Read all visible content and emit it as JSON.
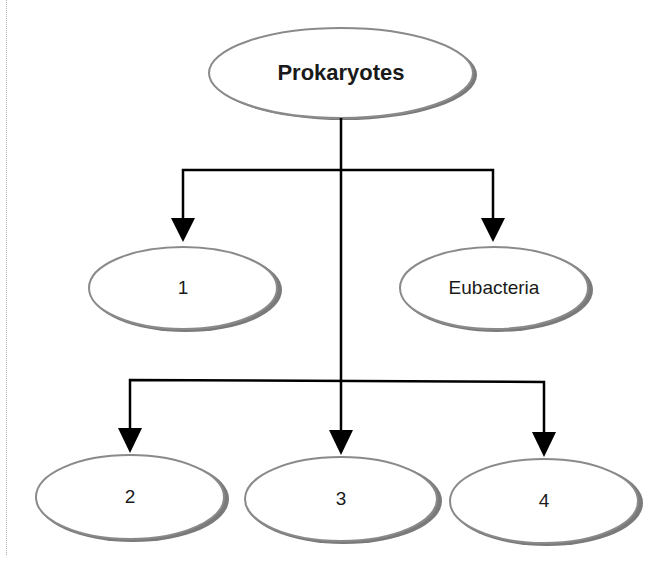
{
  "diagram": {
    "type": "hierarchy",
    "root": {
      "id": "prokaryotes",
      "label": "Prokaryotes",
      "cx": 341,
      "cy": 73
    },
    "nodes": [
      {
        "id": "node-1",
        "label": "1",
        "cx": 183,
        "cy": 288
      },
      {
        "id": "node-eubacteria",
        "label": "Eubacteria",
        "cx": 494,
        "cy": 288
      },
      {
        "id": "node-2",
        "label": "2",
        "cx": 130,
        "cy": 497
      },
      {
        "id": "node-3",
        "label": "3",
        "cx": 341,
        "cy": 499
      },
      {
        "id": "node-4",
        "label": "4",
        "cx": 544,
        "cy": 501
      }
    ],
    "edges": [
      {
        "from": "Prokaryotes",
        "to": "1"
      },
      {
        "from": "Prokaryotes",
        "to": "Eubacteria"
      },
      {
        "from": "Prokaryotes",
        "to": "2"
      },
      {
        "from": "Prokaryotes",
        "to": "3"
      },
      {
        "from": "Prokaryotes",
        "to": "4"
      }
    ],
    "colors": {
      "line": "#000000",
      "ellipse_stroke": "#8a8a8a",
      "shadow": "#7a7a7a",
      "fill": "#ffffff"
    }
  }
}
